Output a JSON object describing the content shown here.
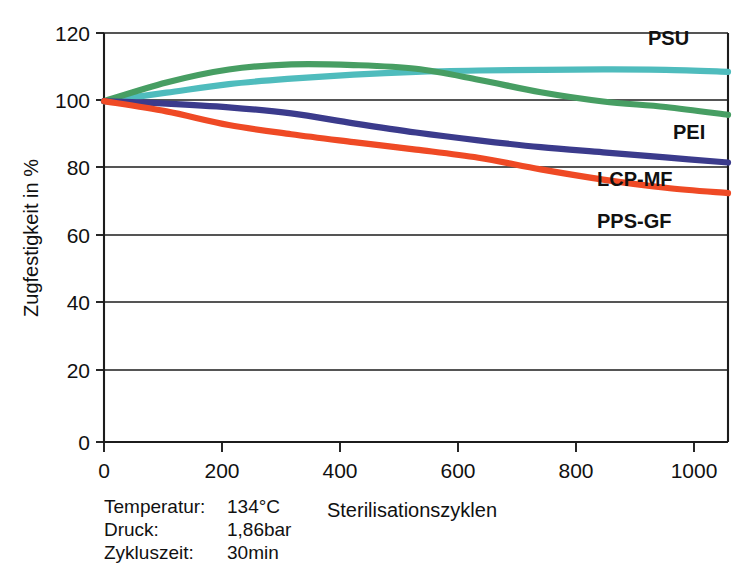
{
  "chart_data": {
    "type": "line",
    "title": "",
    "xlabel": "Sterilisationszyklen",
    "ylabel": "Zugfestigkeit in %",
    "xlim": [
      0,
      1000
    ],
    "ylim": [
      0,
      120
    ],
    "grid": true,
    "legend_position": "inline-right",
    "x_ticks": [
      0,
      200,
      400,
      600,
      800,
      1000
    ],
    "y_ticks": [
      0,
      20,
      40,
      60,
      80,
      100,
      120
    ],
    "x_tick_labels": [
      "0",
      "200",
      "400",
      "600",
      "800",
      "1000"
    ],
    "y_tick_labels": [
      "0",
      "20",
      "40",
      "60",
      "80",
      "100",
      "120"
    ],
    "x": [
      0,
      100,
      200,
      300,
      400,
      500,
      600,
      700,
      800,
      900,
      1000
    ],
    "series": [
      {
        "name": "PSU",
        "color": "#4fbcbd",
        "values": [
          100,
          102.5,
          105.0,
          106.6,
          107.8,
          108.6,
          109.0,
          109.2,
          109.3,
          109.2,
          108.6
        ]
      },
      {
        "name": "PEI",
        "color": "#479e63",
        "values": [
          100,
          105.5,
          109.3,
          110.8,
          110.6,
          109.5,
          106.3,
          102.6,
          99.9,
          98.3,
          96.0
        ]
      },
      {
        "name": "LCP-MF",
        "color": "#3b3b8c",
        "values": [
          100,
          99.3,
          98.2,
          96.4,
          93.5,
          90.8,
          88.5,
          86.5,
          85.0,
          83.5,
          82.0
        ]
      },
      {
        "name": "PPS-GF",
        "color": "#ef4a25",
        "values": [
          100,
          97.0,
          93.0,
          90.3,
          88.0,
          85.8,
          83.4,
          80.0,
          77.0,
          74.6,
          73.0
        ]
      }
    ],
    "annotations": [
      {
        "label": "Temperatur:",
        "value": "134°C"
      },
      {
        "label": "Druck:",
        "value": "1,86bar"
      },
      {
        "label": "Zykluszeit:",
        "value": "30min"
      }
    ]
  },
  "colors": {
    "axis": "#1c1c1c",
    "background": "#ffffff",
    "psu": "#4fbcbd",
    "pei": "#479e63",
    "lcp_mf": "#3b3b8c",
    "pps_gf": "#ef4a25"
  }
}
